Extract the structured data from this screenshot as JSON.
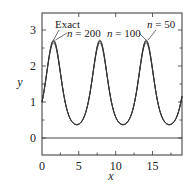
{
  "chart_data": {
    "type": "line",
    "title": "",
    "xlabel": "x",
    "ylabel": "y",
    "xlim": [
      0,
      19
    ],
    "ylim": [
      -0.47,
      3.47
    ],
    "xticks": [
      0,
      5,
      10,
      15
    ],
    "yticks": [
      0,
      1,
      2,
      3
    ],
    "grid": false,
    "reference_line_y": 0,
    "series": [
      {
        "name": "Exact",
        "function": "exp(sin x)",
        "x": [
          0,
          1.57,
          4.71,
          7.85,
          10.99,
          14.14,
          17.28,
          19
        ],
        "values": [
          1.0,
          2.72,
          0.37,
          2.72,
          0.37,
          2.72,
          0.37,
          1.16
        ]
      },
      {
        "name": "n = 200",
        "x": [
          0,
          1.57,
          4.71,
          7.85,
          10.99,
          14.14,
          17.28,
          19
        ],
        "values": [
          1.0,
          2.7,
          0.37,
          2.7,
          0.37,
          2.7,
          0.37,
          1.16
        ]
      },
      {
        "name": "n = 100",
        "x": [
          0,
          1.57,
          4.71,
          7.85,
          10.99,
          14.14,
          17.28,
          19
        ],
        "values": [
          1.0,
          2.68,
          0.37,
          2.68,
          0.37,
          2.68,
          0.37,
          1.16
        ]
      },
      {
        "name": "n = 50",
        "x": [
          0,
          1.57,
          4.71,
          7.85,
          10.99,
          14.14,
          17.28,
          19
        ],
        "values": [
          1.0,
          2.64,
          0.38,
          2.64,
          0.38,
          2.64,
          0.38,
          1.16
        ]
      }
    ],
    "annotations": [
      {
        "text": "Exact",
        "points_to_x": 1.57
      },
      {
        "text": "n = 200",
        "points_to_x": 1.57
      },
      {
        "text": "n = 100",
        "points_to_x": 14.14
      },
      {
        "text": "n = 50",
        "points_to_x": 14.14
      }
    ]
  },
  "labels": {
    "xlabel": "x",
    "ylabel": "y",
    "xticks": [
      "0",
      "5",
      "10",
      "15"
    ],
    "yticks": [
      "0",
      "1",
      "2",
      "3"
    ],
    "ann_exact": "Exact",
    "ann_n200_n": "n",
    "ann_n200_rest": " = 200",
    "ann_n100_n": "n",
    "ann_n100_rest": " = 100",
    "ann_n50_n": "n",
    "ann_n50_rest": " = 50"
  }
}
